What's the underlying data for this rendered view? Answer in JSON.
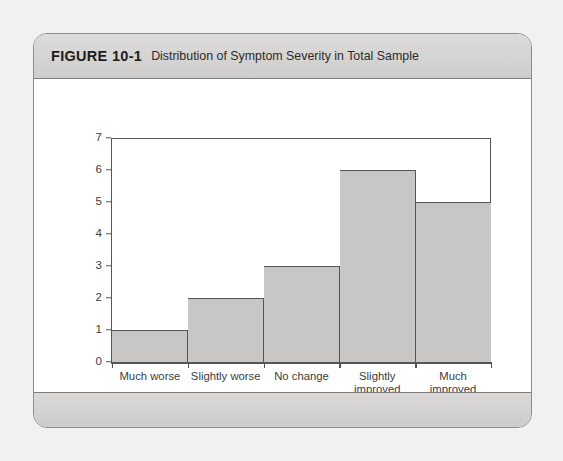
{
  "figure": {
    "label": "FIGURE 10-1",
    "caption": "Distribution of Symptom Severity in Total Sample"
  },
  "chart_data": {
    "type": "bar",
    "title": "Distribution of Symptom Severity in Total Sample",
    "xlabel": "Symptom Severity",
    "ylabel": "Number of Participants",
    "categories": [
      "Much worse",
      "Slightly worse",
      "No change",
      "Slightly\nimproved",
      "Much\nimproved"
    ],
    "values": [
      1,
      2,
      3,
      6,
      5
    ],
    "ylim": [
      0,
      7
    ],
    "yticks": [
      0,
      1,
      2,
      3,
      4,
      5,
      6,
      7
    ],
    "ytick_labels": [
      "0",
      "1",
      "2",
      "3",
      "4",
      "5",
      "6",
      "7"
    ],
    "grid": false,
    "legend": false,
    "bar_gap": 0,
    "colors": {
      "bar_fill": "#c9c7c5",
      "bar_edge": "#555555",
      "axis": "#555555",
      "text": "#3c3c3c",
      "plot_background": "#ffffff",
      "band_background": "#d6d4d2",
      "page_background": "#f3f1ef"
    }
  }
}
